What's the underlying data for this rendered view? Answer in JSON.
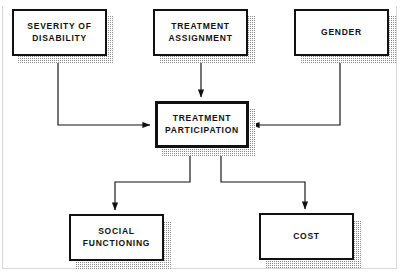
{
  "diagram": {
    "type": "path-diagram",
    "title": "",
    "background_color": "#ffffff",
    "line_color": "#111111",
    "box_border_color": "#111111",
    "box_fill_color": "#ffffff",
    "shadow_color": "#8a8a8a",
    "nodes": [
      {
        "id": "severity",
        "label": "SEVERITY  OF\nDISABILITY",
        "level": "predictor"
      },
      {
        "id": "assignment",
        "label": "TREATMENT\nASSIGNMENT",
        "level": "predictor"
      },
      {
        "id": "gender",
        "label": "GENDER",
        "level": "predictor"
      },
      {
        "id": "participation",
        "label": "TREATMENT\nPARTICIPATION",
        "level": "mediator"
      },
      {
        "id": "social",
        "label": "SOCIAL\nFUNCTIONING",
        "level": "outcome"
      },
      {
        "id": "cost",
        "label": "COST",
        "level": "outcome"
      }
    ],
    "edges": [
      {
        "from": "severity",
        "to": "participation",
        "arrow": "to-left-side"
      },
      {
        "from": "assignment",
        "to": "participation",
        "arrow": "to-top"
      },
      {
        "from": "gender",
        "to": "participation",
        "arrow": "to-right-side"
      },
      {
        "from": "participation",
        "to": "social",
        "arrow": "to-top"
      },
      {
        "from": "participation",
        "to": "cost",
        "arrow": "to-top"
      }
    ]
  }
}
